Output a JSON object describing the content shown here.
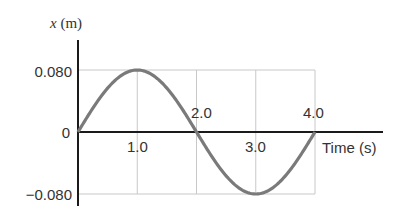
{
  "chart_data": {
    "type": "line",
    "title": "",
    "xlabel": "Time (s)",
    "ylabel_var": "x",
    "ylabel_unit": "(m)",
    "x_ticks_labels": [
      "1.0",
      "2.0",
      "3.0",
      "4.0"
    ],
    "x_ticks": [
      1.0,
      2.0,
      3.0,
      4.0
    ],
    "y_tick_labels": [
      "0.080",
      "0",
      "−0.080"
    ],
    "y_ticks": [
      0.08,
      0,
      -0.08
    ],
    "xlim": [
      0,
      4.0
    ],
    "ylim": [
      -0.08,
      0.08
    ],
    "grid": true,
    "series": [
      {
        "name": "x(t) = 0.080 sin(πt/2)",
        "amplitude": 0.08,
        "period": 4.0,
        "x": [
          0,
          0.5,
          1.0,
          1.5,
          2.0,
          2.5,
          3.0,
          3.5,
          4.0
        ],
        "values": [
          0,
          0.0566,
          0.08,
          0.0566,
          0,
          -0.0566,
          -0.08,
          -0.0566,
          0
        ]
      }
    ],
    "colors": {
      "curve": "#7a7a7a",
      "axis": "#1a1a1a",
      "grid": "#c8c8c8"
    }
  }
}
